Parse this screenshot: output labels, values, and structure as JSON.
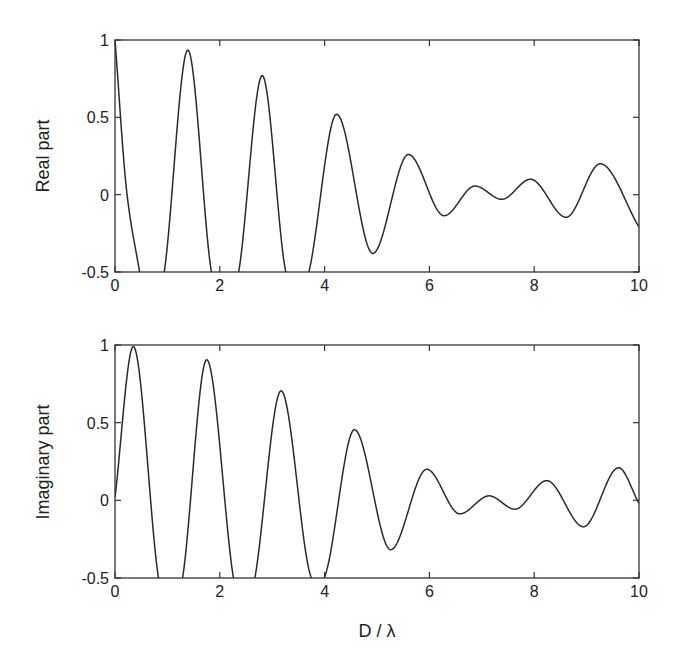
{
  "chart_data": [
    {
      "type": "line",
      "title": "",
      "xlabel": "",
      "ylabel": "Real part",
      "xlim": [
        0,
        10
      ],
      "ylim": [
        -0.5,
        1
      ],
      "xticks": [
        "0",
        "2",
        "4",
        "6",
        "8",
        "10"
      ],
      "yticks": [
        "-0.5",
        "0",
        "0.5",
        "1"
      ],
      "grid": false,
      "series": [
        {
          "name": "Real part",
          "x": [
            0,
            0.23,
            0.47,
            0.7,
            0.94,
            1.39,
            1.84,
            2.1,
            2.36,
            2.81,
            3.26,
            3.48,
            3.7,
            4.23,
            4.92,
            5.6,
            6.28,
            6.87,
            7.38,
            7.93,
            8.61,
            9.26,
            10.0
          ],
          "values": [
            1.0,
            0.0,
            -0.5,
            -0.95,
            -0.5,
            0.935,
            -0.5,
            -0.9,
            -0.5,
            0.77,
            -0.5,
            -0.75,
            -0.5,
            0.52,
            -0.38,
            0.26,
            -0.136,
            0.056,
            -0.03,
            0.1,
            -0.146,
            0.2,
            -0.21
          ]
        }
      ]
    },
    {
      "type": "line",
      "title": "",
      "xlabel": "D / λ",
      "ylabel": "Imaginary part",
      "xlim": [
        0,
        10
      ],
      "ylim": [
        -0.5,
        1
      ],
      "xticks": [
        "0",
        "2",
        "4",
        "6",
        "8",
        "10"
      ],
      "yticks": [
        "-0.5",
        "0",
        "0.5",
        "1"
      ],
      "grid": false,
      "series": [
        {
          "name": "Imaginary part",
          "x": [
            0,
            0.35,
            0.83,
            1.06,
            1.29,
            1.75,
            2.26,
            2.46,
            2.67,
            3.17,
            3.75,
            3.87,
            3.99,
            4.57,
            5.26,
            5.95,
            6.58,
            7.14,
            7.63,
            8.24,
            8.94,
            9.61,
            10.0
          ],
          "values": [
            0.02,
            0.99,
            -0.5,
            -0.9,
            -0.5,
            0.905,
            -0.5,
            -0.85,
            -0.5,
            0.705,
            -0.5,
            -0.56,
            -0.5,
            0.455,
            -0.318,
            0.2,
            -0.087,
            0.029,
            -0.057,
            0.127,
            -0.17,
            0.21,
            -0.02
          ]
        }
      ]
    }
  ]
}
